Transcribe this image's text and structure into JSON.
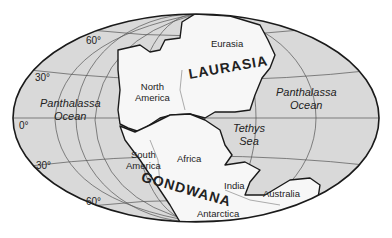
{
  "map": {
    "projection": "elliptical",
    "colors": {
      "ocean": "#d9d9d9",
      "land": "#f7f7f7",
      "outline": "#1a1a1a",
      "grid": "#555555"
    },
    "latitude_labels": {
      "n60": "60°",
      "n30": "30°",
      "eq": "0°",
      "s30": "30°",
      "s60": "60°"
    },
    "oceans": {
      "panthalassa_west": {
        "line1": "Panthalassa",
        "line2": "Ocean"
      },
      "panthalassa_east": {
        "line1": "Panthalassa",
        "line2": "Ocean"
      },
      "tethys": {
        "line1": "Tethys",
        "line2": "Sea"
      }
    },
    "supercontinents": {
      "laurasia": "LAURASIA",
      "gondwana": "GONDWANA"
    },
    "continents": {
      "eurasia": "Eurasia",
      "north_america": {
        "line1": "North",
        "line2": "America"
      },
      "south_america": {
        "line1": "South",
        "line2": "America"
      },
      "africa": "Africa",
      "india": "India",
      "australia": "Australia",
      "antarctica": "Antarctica"
    }
  }
}
